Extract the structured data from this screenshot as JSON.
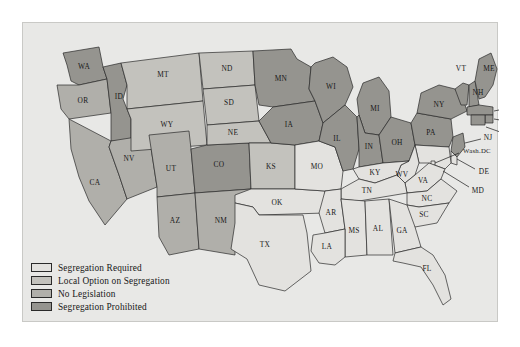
{
  "figure": {
    "panel_bg": "#e8e8e6",
    "water_color": "#eeedec",
    "border_color": "#2a2a2a"
  },
  "legend": {
    "items": [
      {
        "key": "required",
        "label": "Segregation Required",
        "color": "#e3e2df"
      },
      {
        "key": "local",
        "label": "Local Option on Segregation",
        "color": "#c3c2bd"
      },
      {
        "key": "none",
        "label": "No Legislation",
        "color": "#b0afaa"
      },
      {
        "key": "prohibited",
        "label": "Segregation Prohibited",
        "color": "#95948f"
      }
    ]
  },
  "map": {
    "states": [
      {
        "code": "WA",
        "category": "prohibited"
      },
      {
        "code": "OR",
        "category": "none"
      },
      {
        "code": "ID",
        "category": "prohibited"
      },
      {
        "code": "MT",
        "category": "local"
      },
      {
        "code": "WY",
        "category": "local"
      },
      {
        "code": "ND",
        "category": "local"
      },
      {
        "code": "SD",
        "category": "local"
      },
      {
        "code": "NE",
        "category": "local"
      },
      {
        "code": "MN",
        "category": "prohibited"
      },
      {
        "code": "WI",
        "category": "prohibited"
      },
      {
        "code": "IA",
        "category": "prohibited"
      },
      {
        "code": "IL",
        "category": "prohibited"
      },
      {
        "code": "MI",
        "category": "prohibited"
      },
      {
        "code": "IN",
        "category": "prohibited"
      },
      {
        "code": "OH",
        "category": "prohibited"
      },
      {
        "code": "PA",
        "category": "prohibited"
      },
      {
        "code": "NY",
        "category": "prohibited"
      },
      {
        "code": "VT",
        "category": "prohibited"
      },
      {
        "code": "NH",
        "category": "prohibited"
      },
      {
        "code": "ME",
        "category": "prohibited"
      },
      {
        "code": "MA",
        "category": "prohibited"
      },
      {
        "code": "RI",
        "category": "prohibited"
      },
      {
        "code": "CT",
        "category": "prohibited"
      },
      {
        "code": "NJ",
        "category": "prohibited"
      },
      {
        "code": "CO",
        "category": "prohibited"
      },
      {
        "code": "NV",
        "category": "none"
      },
      {
        "code": "CA",
        "category": "none"
      },
      {
        "code": "UT",
        "category": "none"
      },
      {
        "code": "AZ",
        "category": "none"
      },
      {
        "code": "NM",
        "category": "none"
      },
      {
        "code": "KS",
        "category": "local"
      },
      {
        "code": "MO",
        "category": "required"
      },
      {
        "code": "OK",
        "category": "required"
      },
      {
        "code": "TX",
        "category": "required"
      },
      {
        "code": "AR",
        "category": "required"
      },
      {
        "code": "LA",
        "category": "required"
      },
      {
        "code": "MS",
        "category": "required"
      },
      {
        "code": "AL",
        "category": "required"
      },
      {
        "code": "GA",
        "category": "required"
      },
      {
        "code": "FL",
        "category": "required"
      },
      {
        "code": "TN",
        "category": "required"
      },
      {
        "code": "KY",
        "category": "required"
      },
      {
        "code": "SC",
        "category": "required"
      },
      {
        "code": "NC",
        "category": "required"
      },
      {
        "code": "VA",
        "category": "required"
      },
      {
        "code": "WV",
        "category": "required"
      },
      {
        "code": "MD",
        "category": "required"
      },
      {
        "code": "DE",
        "category": "required"
      },
      {
        "code": "Wash.DC",
        "category": "required"
      }
    ]
  }
}
